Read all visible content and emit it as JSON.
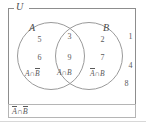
{
  "diagram": {
    "type": "venn",
    "universe": {
      "label": "U"
    },
    "sets": [
      {
        "key": "A",
        "label": "A"
      },
      {
        "key": "B",
        "label": "B"
      }
    ],
    "regions": [
      {
        "key": "a_only",
        "label_parts": [
          "A",
          "∩",
          "B"
        ],
        "label_plain": "A∩B̅",
        "elements": [
          "5",
          "6"
        ]
      },
      {
        "key": "intersection",
        "label_parts": [
          "A",
          "∩",
          "B"
        ],
        "label_plain": "A∩B",
        "elements": [
          "3",
          "9"
        ]
      },
      {
        "key": "b_only",
        "label_parts": [
          "A",
          "∩",
          "B"
        ],
        "label_plain": "A̅∩B",
        "elements": [
          "2",
          "7"
        ]
      },
      {
        "key": "outside",
        "label_parts": [
          "A",
          "∩",
          "B"
        ],
        "label_plain": "A̅∩B̅",
        "elements": [
          "1",
          "4",
          "8"
        ]
      }
    ],
    "elements": {
      "a_only_top": "5",
      "a_only_bottom": "6",
      "intersection_top": "3",
      "intersection_bottom": "9",
      "b_only_top": "2",
      "b_only_bottom": "7",
      "outside_top": "1",
      "outside_middle": "4",
      "outside_bottom": "8"
    },
    "region_labels": {
      "a_not_b": {
        "first": "A",
        "op": "∩",
        "second": "B"
      },
      "a_and_b": {
        "first": "A",
        "op": "∩",
        "second": "B"
      },
      "not_a_b": {
        "first": "A",
        "op": "∩",
        "second": "B"
      },
      "not_a_not_b": {
        "first": "A",
        "op": "∩",
        "second": "B"
      }
    },
    "colors": {
      "stroke": "#9a9a9a",
      "text": "#5a5a5a",
      "frame": "#8d8d8d",
      "background": "#ffffff"
    }
  }
}
